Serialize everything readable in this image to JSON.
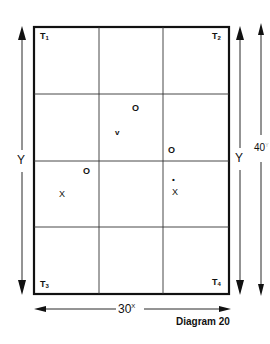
{
  "diagram": {
    "caption": "Diagram 20",
    "grid": {
      "columns": 3,
      "rows": 4
    },
    "corners": [
      {
        "id": "T1",
        "base": "T",
        "sub": "1",
        "position": "top-left"
      },
      {
        "id": "T2",
        "base": "T",
        "sub": "2",
        "position": "top-right"
      },
      {
        "id": "T3",
        "base": "T",
        "sub": "3",
        "position": "bottom-left"
      },
      {
        "id": "T4",
        "base": "T",
        "sub": "4",
        "position": "bottom-right"
      }
    ],
    "dimensions": {
      "left_height_label": "Y",
      "right_inner_height_label": "Y",
      "right_outer_height_label": "40",
      "right_outer_height_sup": "Y",
      "bottom_width_label": "30",
      "bottom_width_sup": "X"
    },
    "points": [
      {
        "symbol": "O",
        "cell": "row2-col2-top"
      },
      {
        "symbol": "v",
        "cell": "row2-col2-mid"
      },
      {
        "symbol": "O",
        "cell": "row2-col3-bottom"
      },
      {
        "symbol": "O",
        "cell": "row3-col1-top"
      },
      {
        "symbol": "X",
        "cell": "row3-col1-mid"
      },
      {
        "symbol": "•",
        "cell": "row3-col3"
      },
      {
        "symbol": "X",
        "cell": "row3-col3"
      }
    ]
  }
}
